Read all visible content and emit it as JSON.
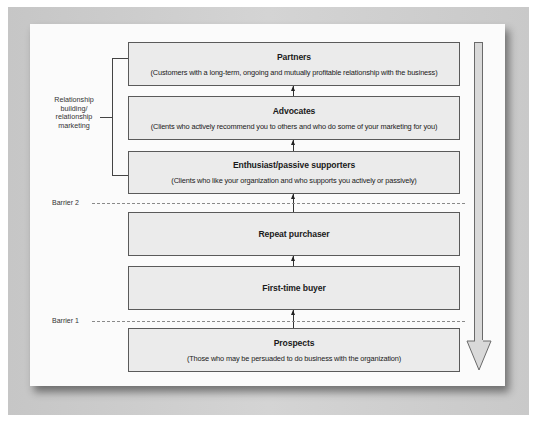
{
  "diagram": {
    "type": "customer loyalty ladder",
    "side_label": "Relationship building/ relationship marketing",
    "side_label_lines": [
      "Relationship",
      "building/",
      "relationship",
      "marketing"
    ],
    "barriers": [
      {
        "label": "Barrier 2"
      },
      {
        "label": "Barrier 1"
      }
    ],
    "stages": [
      {
        "title": "Partners",
        "description": "(Customers with a long-term, ongoing and mutually profitable relationship with the business)"
      },
      {
        "title": "Advocates",
        "description": "(Clients who actively recommend you to others and who do some of your marketing for you)"
      },
      {
        "title": "Enthusiast/passive supporters",
        "description": "(Clients who like your organization and who supports you actively or passively)"
      },
      {
        "title": "Repeat purchaser",
        "description": ""
      },
      {
        "title": "First-time buyer",
        "description": ""
      },
      {
        "title": "Prospects",
        "description": "(Those who may be persuaded to do business with the organization)"
      }
    ],
    "colors": {
      "box_fill": "#ebebeb",
      "box_border": "#5a5a5a",
      "frame": "#c9c9c9",
      "paper": "#fbfbfb",
      "arrow_fill": "#d9d9d9"
    }
  }
}
